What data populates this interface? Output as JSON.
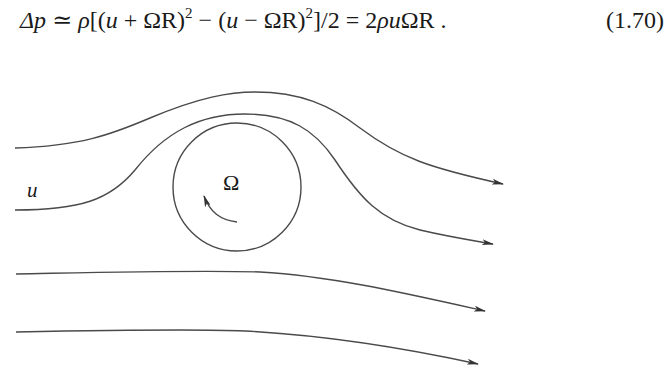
{
  "equation": {
    "lhs": "Δp",
    "relation": "≃",
    "rho": "ρ",
    "open": "[(",
    "u1": "u",
    "plus": " + ",
    "omegaR1": "ΩR",
    "close1": ")",
    "exp1": "2",
    "minus": " − (",
    "u2": "u",
    "minus2": " − ",
    "omegaR2": "ΩR",
    "close2": ")",
    "exp2": "2",
    "tail": "]/2 = 2",
    "rho2": "ρ",
    "u3": "u",
    "omegaR3": "ΩR",
    "period": " .",
    "number": "(1.70)"
  },
  "figure": {
    "flow_label": "u",
    "rotation_label": "Ω",
    "line_color": "#4a4a4a",
    "streamlines": 4,
    "cylinder": {
      "cx": 237,
      "cy": 187,
      "r": 64
    }
  }
}
